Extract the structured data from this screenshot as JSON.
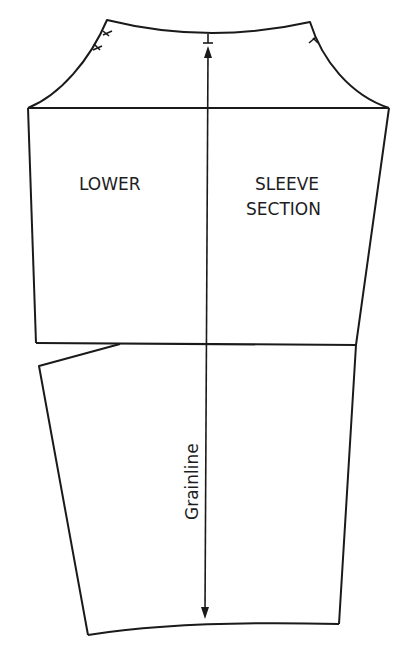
{
  "diagram": {
    "labels": {
      "lower": "LOWER",
      "sleeve_line1": "SLEEVE",
      "sleeve_line2": "SECTION",
      "grainline": "Grainline"
    },
    "colors": {
      "line": "#1a1a1a",
      "background": "#ffffff"
    },
    "notches": {
      "back_cap": 2,
      "top_center": 1,
      "front_cap": 1
    }
  }
}
